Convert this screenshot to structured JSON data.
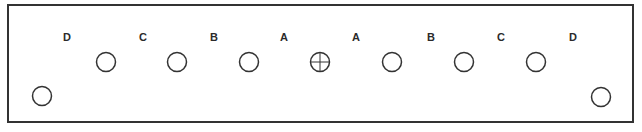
{
  "diagram": {
    "frame": {
      "x": 8,
      "y": 5,
      "width": 625,
      "height": 117,
      "stroke": "#333333"
    },
    "labels": [
      {
        "text": "D",
        "x": 67
      },
      {
        "text": "C",
        "x": 143
      },
      {
        "text": "B",
        "x": 214
      },
      {
        "text": "A",
        "x": 284
      },
      {
        "text": "A",
        "x": 356
      },
      {
        "text": "B",
        "x": 431
      },
      {
        "text": "C",
        "x": 501
      },
      {
        "text": "D",
        "x": 573
      }
    ],
    "holes_top_row": [
      {
        "x": 106,
        "y": 62,
        "type": "plain"
      },
      {
        "x": 177,
        "y": 62,
        "type": "plain"
      },
      {
        "x": 249,
        "y": 62,
        "type": "plain"
      },
      {
        "x": 320,
        "y": 62,
        "type": "center-crosshair"
      },
      {
        "x": 392,
        "y": 62,
        "type": "plain"
      },
      {
        "x": 464,
        "y": 62,
        "type": "plain"
      },
      {
        "x": 536,
        "y": 62,
        "type": "plain"
      }
    ],
    "holes_corner": [
      {
        "x": 42,
        "y": 96,
        "type": "plain"
      },
      {
        "x": 601,
        "y": 97,
        "type": "plain"
      }
    ]
  }
}
